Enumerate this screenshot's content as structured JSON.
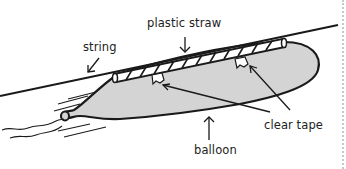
{
  "diagram": {
    "labels": {
      "straw": "plastic straw",
      "string": "string",
      "tape": "clear tape",
      "balloon": "balloon"
    },
    "colors": {
      "balloon_fill": "#d4d4d4",
      "outline": "#1a1a1a",
      "straw_fill": "#ffffff",
      "text": "#222222",
      "border_dots": "#c8c8c8"
    }
  }
}
